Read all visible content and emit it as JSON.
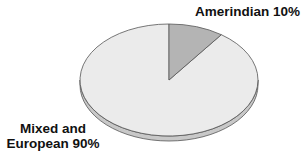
{
  "chart_data": {
    "type": "pie",
    "title": "",
    "style": "3d-tilted",
    "start_angle": "12 o'clock",
    "direction": "clockwise",
    "slices": [
      {
        "label": "Amerindian",
        "value": 10,
        "display": "Amerindian 10%",
        "color": "#b4b4b4"
      },
      {
        "label": "Mixed and European",
        "value": 90,
        "display_line1": "Mixed and",
        "display_line2": "European 90%",
        "color": "#ebebeb"
      }
    ],
    "side_color": "#c8c8c8",
    "edge_color": "#555555"
  }
}
